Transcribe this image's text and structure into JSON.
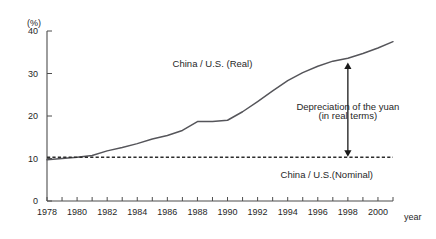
{
  "chart_data": {
    "type": "line",
    "title": "",
    "xlabel": "year",
    "ylabel": "(%)",
    "xlim": [
      1978,
      2001
    ],
    "ylim": [
      0,
      40
    ],
    "grid": false,
    "legend_position": "inline-annotations",
    "x": [
      1978,
      1979,
      1980,
      1981,
      1982,
      1983,
      1984,
      1985,
      1986,
      1987,
      1988,
      1989,
      1990,
      1991,
      1992,
      1993,
      1994,
      1995,
      1996,
      1997,
      1998,
      1999,
      2000,
      2001
    ],
    "y_tick_labels": [
      "0",
      "10",
      "20",
      "30",
      "40"
    ],
    "y_ticks": [
      0,
      10,
      20,
      30,
      40
    ],
    "x_tick_labels": [
      "1978",
      "1980",
      "1982",
      "1984",
      "1986",
      "1988",
      "1990",
      "1992",
      "1994",
      "1996",
      "1998",
      "2000"
    ],
    "x_ticks_labeled": [
      1978,
      1980,
      1982,
      1984,
      1986,
      1988,
      1990,
      1992,
      1994,
      1996,
      1998,
      2000
    ],
    "series": [
      {
        "name": "China / U.S. (Real)",
        "style": "solid",
        "color": "#55555a",
        "values": [
          9.7,
          10.0,
          10.3,
          10.7,
          11.8,
          12.6,
          13.5,
          14.6,
          15.4,
          16.6,
          18.7,
          18.7,
          19.0,
          21.0,
          23.4,
          25.9,
          28.3,
          30.2,
          31.7,
          32.9,
          33.6,
          34.7,
          36.0,
          37.5
        ]
      },
      {
        "name": "China / U.S.(Nominal)",
        "style": "dashed",
        "color": "#2d2d2d",
        "values": [
          10.3,
          10.3,
          10.3,
          10.3,
          10.3,
          10.3,
          10.3,
          10.3,
          10.3,
          10.3,
          10.3,
          10.3,
          10.3,
          10.3,
          10.3,
          10.3,
          10.3,
          10.3,
          10.3,
          10.3,
          10.3,
          10.3,
          10.3,
          10.3
        ]
      }
    ],
    "annotations": [
      {
        "id": "real-series-label",
        "text": "China / U.S. (Real)",
        "x": 1989.0,
        "y": 31.5
      },
      {
        "id": "nominal-series-label",
        "text": "China / U.S.(Nominal)",
        "x": 1996.6,
        "y": 5.3
      },
      {
        "id": "depreciation-note-line1",
        "text": "Depreciation of the yuan",
        "x": 1998.0,
        "y": 21.5
      },
      {
        "id": "depreciation-note-line2",
        "text": "(in real terms)",
        "x": 1998.0,
        "y": 19.3
      },
      {
        "id": "depreciation-arrow",
        "type": "double-headed-vertical-arrow",
        "x": 1998.0,
        "y_from": 10.4,
        "y_to": 32.6
      }
    ]
  },
  "axis": {
    "unit_label": "(%)",
    "x_axis_name": "year"
  }
}
